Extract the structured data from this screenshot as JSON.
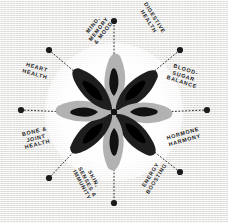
{
  "poster": {
    "title": "Eight Pillars of Wellness Radial Diagram",
    "background_color": "#f3f2f0",
    "ink_color": "#1b1b1b",
    "petal_dark_color": "#1e1e1e",
    "petal_light_color": "#b2b2b2",
    "petal_seed_color": "#111111",
    "halo_color": "#ffffff",
    "spoke_count": 8
  },
  "center_graphic": {
    "name": "eight-petal-flower",
    "petals": [
      {
        "index": 0,
        "angle_deg": 0,
        "tone": "light"
      },
      {
        "index": 1,
        "angle_deg": 45,
        "tone": "dark"
      },
      {
        "index": 2,
        "angle_deg": 90,
        "tone": "light"
      },
      {
        "index": 3,
        "angle_deg": 135,
        "tone": "dark"
      },
      {
        "index": 4,
        "angle_deg": 180,
        "tone": "light"
      },
      {
        "index": 5,
        "angle_deg": 225,
        "tone": "dark"
      },
      {
        "index": 6,
        "angle_deg": 270,
        "tone": "light"
      },
      {
        "index": 7,
        "angle_deg": 315,
        "tone": "dark"
      }
    ]
  },
  "spokes": [
    {
      "id": "mind-memory-mood",
      "label": "MIND,\n MEMORY\n& MOOD",
      "angle_deg": 270,
      "dot": {
        "x": 114,
        "y": 21
      },
      "label_pos": {
        "x": 84,
        "y": 19
      },
      "label_rotation_deg": -52
    },
    {
      "id": "digestive-health",
      "label": "DIGESTIVE\nHEALTH",
      "angle_deg": 315,
      "dot": {
        "x": 180,
        "y": 50
      },
      "label_pos": {
        "x": 134,
        "y": 13
      },
      "label_rotation_deg": 58
    },
    {
      "id": "blood-sugar-balance",
      "label": "BLOOD-\nSUGAR\nBALANCE",
      "angle_deg": 0,
      "dot": {
        "x": 207,
        "y": 110
      },
      "label_pos": {
        "x": 168,
        "y": 66
      },
      "label_rotation_deg": 18
    },
    {
      "id": "hormone-harmony",
      "label": "HORMONE\nHARMONY",
      "angle_deg": 45,
      "dot": {
        "x": 180,
        "y": 172
      },
      "label_pos": {
        "x": 167,
        "y": 130
      },
      "label_rotation_deg": -16
    },
    {
      "id": "energy-boosting",
      "label": "ENERGY\nBOOSTING",
      "angle_deg": 90,
      "dot": {
        "x": 114,
        "y": 203
      },
      "label_pos": {
        "x": 136,
        "y": 170
      },
      "label_rotation_deg": -58
    },
    {
      "id": "skin-senses-immunity",
      "label": "SKIN,\nSENSES &\nIMMUNITY",
      "angle_deg": 135,
      "dot": {
        "x": 49,
        "y": 178
      },
      "label_pos": {
        "x": 71,
        "y": 172
      },
      "label_rotation_deg": 62
    },
    {
      "id": "bone-joint-health",
      "label": "BONE &\nJOINT\nHEALTH",
      "angle_deg": 180,
      "dot": {
        "x": 21,
        "y": 110
      },
      "label_pos": {
        "x": 23,
        "y": 128
      },
      "label_rotation_deg": -14
    },
    {
      "id": "heart-health",
      "label": "HEART\nHEALTH",
      "angle_deg": 225,
      "dot": {
        "x": 49,
        "y": 50
      },
      "label_pos": {
        "x": 23,
        "y": 64
      },
      "label_rotation_deg": 16
    }
  ]
}
